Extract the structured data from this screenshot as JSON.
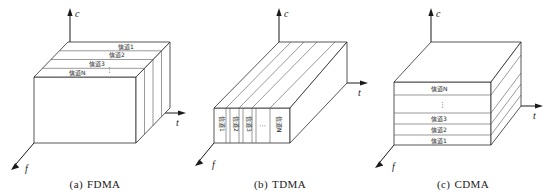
{
  "figure": {
    "channel_label_prefix": "信道",
    "vertical_ellipsis": "⋮",
    "horizontal_ellipsis": "⋯",
    "axes": {
      "code": "c",
      "time": "t",
      "frequency": "f"
    },
    "panels": [
      {
        "id": "fdma",
        "caption_index": "(a)",
        "caption_name": "FDMA",
        "axis_c": "c",
        "axis_t": "t",
        "axis_f": "f",
        "division": "frequency-bands-horizontal-slabs",
        "channels": [
          "信道1",
          "信道2",
          "信道3",
          "信道N"
        ],
        "ellipsis": "⋮"
      },
      {
        "id": "tdma",
        "caption_index": "(b)",
        "caption_name": "TDMA",
        "axis_c": "c",
        "axis_t": "t",
        "axis_f": "f",
        "division": "time-slots-vertical-slices",
        "channels": [
          "信道1",
          "信道2",
          "信道3",
          "信道N"
        ],
        "ellipsis": "⋯"
      },
      {
        "id": "cdma",
        "caption_index": "(c)",
        "caption_name": "CDMA",
        "axis_c": "c",
        "axis_t": "t",
        "axis_f": "f",
        "division": "code-layers-stacked",
        "channels_bottom_to_top": [
          "信道1",
          "信道2",
          "信道3",
          "信道N"
        ],
        "ellipsis": "⋮"
      }
    ]
  }
}
